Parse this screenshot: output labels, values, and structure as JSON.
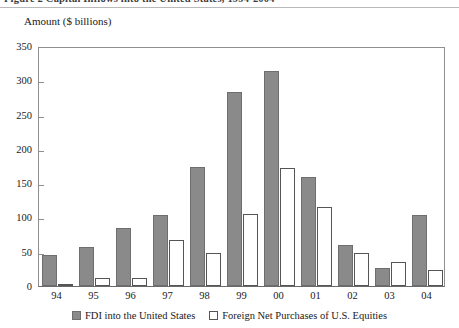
{
  "figure": {
    "caption": "Figure 2   Capital Inflows into the United States, 1994-2004"
  },
  "chart_data": {
    "type": "bar",
    "title": "",
    "ylabel": "Amount ($ billions)",
    "xlabel": "",
    "categories": [
      "94",
      "95",
      "96",
      "97",
      "98",
      "99",
      "00",
      "01",
      "02",
      "03",
      "04"
    ],
    "series": [
      {
        "name": "FDI into the United States",
        "color": "#8a8a8a",
        "values": [
          45,
          57,
          84,
          103,
          174,
          283,
          314,
          159,
          60,
          27,
          103
        ]
      },
      {
        "name": "Foreign Net Purchases of U.S. Equities",
        "color": "#ffffff",
        "values": [
          2,
          11,
          12,
          67,
          48,
          105,
          172,
          115,
          48,
          35,
          23
        ]
      }
    ],
    "ylim": [
      0,
      350
    ],
    "yticks": [
      0,
      50,
      100,
      150,
      200,
      250,
      300,
      350
    ],
    "ytick_labels": [
      "0",
      "50",
      "100",
      "150",
      "200",
      "250",
      "300",
      "350"
    ],
    "grid": false,
    "legend_position": "bottom"
  }
}
